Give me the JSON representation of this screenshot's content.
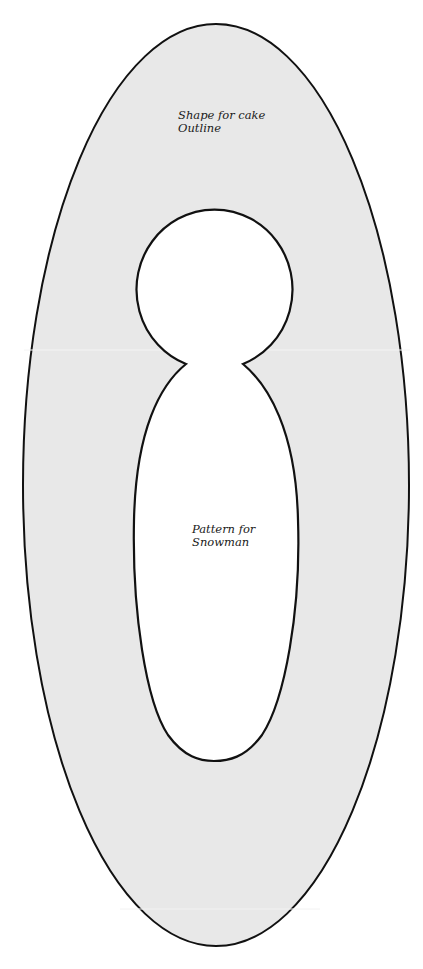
{
  "diagram": {
    "outer_shape": {
      "label_lines": [
        "Shape for cake",
        "Outline"
      ],
      "fill": "#e8e8e8",
      "stroke": "#111111"
    },
    "inner_shape": {
      "label_lines": [
        "Pattern for",
        "Snowman"
      ],
      "fill": "#ffffff",
      "stroke": "#111111"
    },
    "background": "#ffffff"
  }
}
